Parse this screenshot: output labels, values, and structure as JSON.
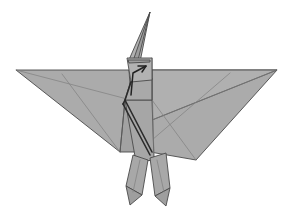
{
  "figure": {
    "background_color": "#ffffff",
    "paper_fill": "#a8a8a8",
    "paper_fill_light": "#b4b4b4",
    "paper_fill_mid": "#aaaaaa",
    "paper_fill_dark": "#9b9b9b",
    "paper_fill_darker": "#949494",
    "edge_color": "#4a4a4a",
    "crease_color": "#6a6a6a",
    "outline_color": "#2b2b2b",
    "width": 293,
    "height": 218
  },
  "parts": {
    "left_wing": "left-wing",
    "right_wing": "right-wing",
    "head": "head",
    "beak": "beak",
    "neck": "neck",
    "body": "body",
    "left_leg": "left-leg",
    "right_leg": "right-leg",
    "left_foot": "left-foot",
    "right_foot": "right-foot",
    "fold_arrow": "fold-arrow"
  },
  "shapes": {
    "beak": "M150,12 L140,62 L128,62 Z",
    "beak_inner": "M150,12 L138,60 L133,61 Z",
    "head": "M127,58 L152,58 L152,80 L131,82 Z",
    "head_inner": "M128,60 L150,60 L150,62 L129,63 Z",
    "neck": "M131,80 L152,78 L152,100 L125,100 Z",
    "left_wing": "M16,70 L129,70 L131,100 L120,152 Z",
    "left_wing_lower": "M125,100 L131,100 L136,152 L120,152 Z",
    "right_wing": "M152,70 L277,70 L196,160 L150,152 Z",
    "right_wing_inner": "M152,70 L277,70 L152,120 Z",
    "body_center": "M125,100 L152,100 L154,160 L136,162 Z",
    "left_leg": "M133,155 L148,160 L142,195 L126,186 Z",
    "right_leg": "M150,158 L166,153 L170,188 L155,196 Z",
    "left_foot": "M126,186 L142,195 L130,205 Z",
    "right_foot": "M170,188 L155,196 L166,206 Z"
  },
  "creases": {
    "left_wing_crease_1": "M16,70 L131,100",
    "left_wing_crease_2": "M62,74 L120,152",
    "left_wing_crease_3": "M125,100 L120,152",
    "right_wing_crease_1": "M277,70 L152,120",
    "right_wing_crease_2": "M230,73 L152,140",
    "right_wing_crease_3": "M152,100 L196,160",
    "body_mid": "M152,78 L154,160",
    "neck_edge": "M152,58 L152,100",
    "left_body_edge": "M131,82 L125,100",
    "leg_center_left": "M140,160 L133,192",
    "leg_center_right": "M157,160 L164,192"
  },
  "outlines": {
    "neck_left_fold": "M131,82 L125,100 L123,104",
    "body_left_fold": "M125,100 L152,152",
    "body_left_fold_2": "M123,104 L150,155"
  },
  "arrow": {
    "path": "M131,95 L133,73 L146,66",
    "head_path": "M146,66 L138,66 M146,66 L142,72"
  }
}
